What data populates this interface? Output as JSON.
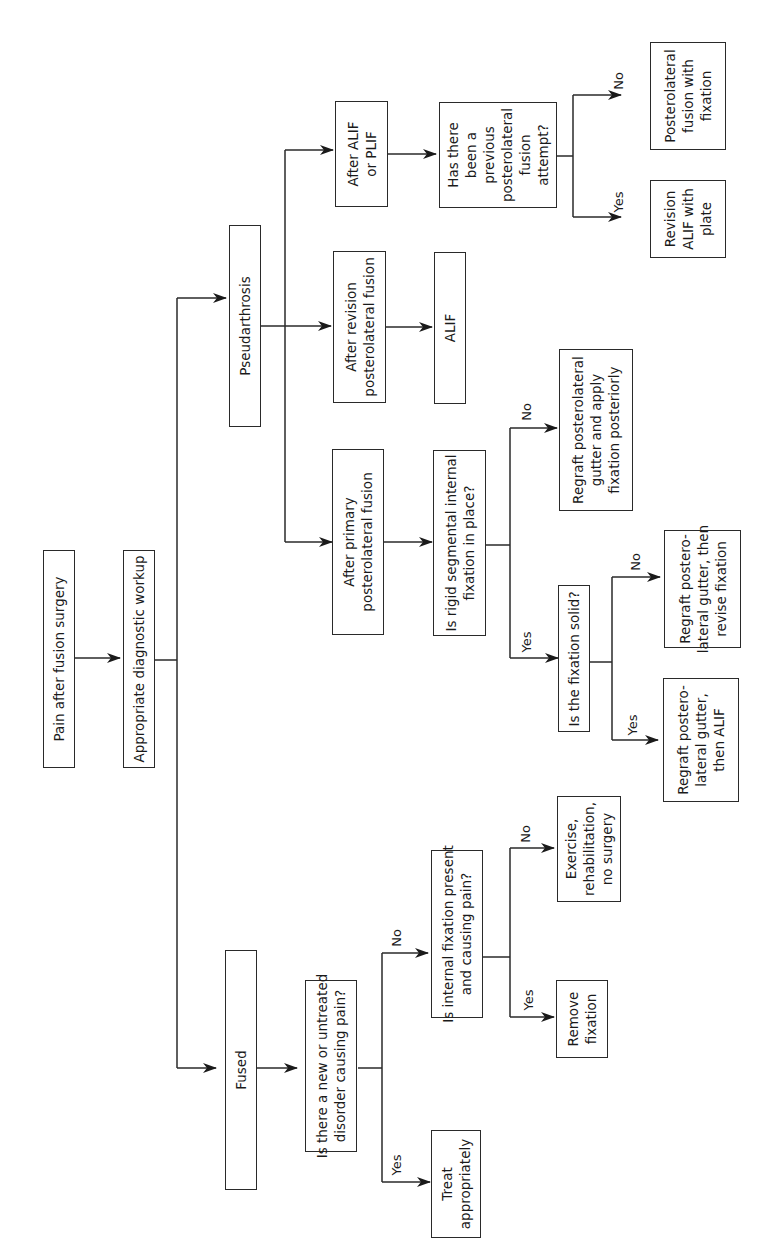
{
  "diagram": {
    "orientation": "rotated-90-ccw",
    "nodes": {
      "pain": "Pain after fusion surgery",
      "workup": "Appropriate diagnostic workup",
      "fused": "Fused",
      "pseudarthrosis": "Pseudarthrosis",
      "new_disorder": "Is there a new or untreated\ndisorder causing pain?",
      "treat": "Treat\nappropriately",
      "internal_fix": "Is internal fixation present\nand causing pain?",
      "remove_fix": "Remove\nfixation",
      "exercise": "Exercise,\nrehabilitation,\nno surgery",
      "after_primary": "After primary\nposterolateral fusion",
      "after_revision": "After revision\nposterolateral fusion",
      "after_alif": "After ALIF\nor PLIF",
      "rigid_fix": "Is rigid segmental internal\nfixation in place?",
      "alif": "ALIF",
      "prev_attempt": "Has there\nbeen a\nprevious\nposterolateral\nfusion\nattempt?",
      "fix_solid": "Is the fixation solid?",
      "regraft_apply": "Regraft posterolateral\ngutter and apply\nfixation posteriorly",
      "regraft_revise": "Regraft postero-\nlateral gutter, then\nrevise fixation",
      "regraft_alif": "Regraft postero-\nlateral gutter,\nthen ALIF",
      "posterolateral_fix": "Posterolateral\nfusion with\nfixation",
      "revision_alif": "Revision\nALIF with\nplate"
    },
    "labels": {
      "yes": "Yes",
      "no": "No"
    }
  }
}
